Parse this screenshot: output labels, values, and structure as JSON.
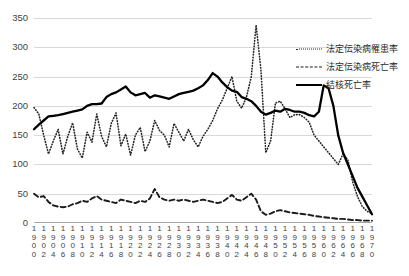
{
  "chart_data": {
    "type": "line",
    "title": "",
    "xlabel": "",
    "ylabel": "",
    "ylim": [
      0,
      350
    ],
    "ytick_step": 50,
    "yticks": [
      "0",
      "50",
      "100",
      "150",
      "200",
      "250",
      "300",
      "350"
    ],
    "grid": true,
    "legend_position": "top-right",
    "x": [
      1900,
      1901,
      1902,
      1903,
      1904,
      1905,
      1906,
      1907,
      1908,
      1909,
      1910,
      1911,
      1912,
      1913,
      1914,
      1915,
      1916,
      1917,
      1918,
      1919,
      1920,
      1921,
      1922,
      1923,
      1924,
      1925,
      1926,
      1927,
      1928,
      1929,
      1930,
      1931,
      1932,
      1933,
      1934,
      1935,
      1936,
      1937,
      1938,
      1939,
      1940,
      1941,
      1942,
      1943,
      1944,
      1945,
      1946,
      1947,
      1948,
      1949,
      1950,
      1951,
      1952,
      1953,
      1954,
      1955,
      1956,
      1957,
      1958,
      1959,
      1960,
      1961,
      1962,
      1963,
      1964,
      1965,
      1966,
      1967,
      1968,
      1969,
      1970
    ],
    "xtick_labels": [
      "1900",
      "1902",
      "1904",
      "1906",
      "1908",
      "1910",
      "1912",
      "1914",
      "1916",
      "1918",
      "1920",
      "1922",
      "1924",
      "1926",
      "1928",
      "1930",
      "1932",
      "1934",
      "1936",
      "1938",
      "1940",
      "1942",
      "1944",
      "1946",
      "1948",
      "1950",
      "1952",
      "1954",
      "1956",
      "1958",
      "1960",
      "1962",
      "1964",
      "1966",
      "1968",
      "1970"
    ],
    "series": [
      {
        "name": "法定伝染病罹患率",
        "style": "dotted",
        "color": "#262626",
        "values": [
          197,
          186,
          150,
          118,
          140,
          160,
          118,
          148,
          171,
          126,
          111,
          155,
          138,
          186,
          148,
          130,
          170,
          188,
          132,
          152,
          116,
          150,
          163,
          122,
          140,
          175,
          158,
          150,
          130,
          170,
          155,
          140,
          160,
          142,
          130,
          148,
          160,
          175,
          195,
          210,
          230,
          250,
          208,
          196,
          215,
          250,
          338,
          262,
          120,
          140,
          205,
          208,
          195,
          180,
          185,
          185,
          180,
          172,
          150,
          140,
          130,
          120,
          110,
          100,
          118,
          108,
          70,
          45,
          28,
          20,
          16
        ]
      },
      {
        "name": "法定伝染病死亡率",
        "style": "dashed",
        "color": "#1a1a1a",
        "values": [
          50,
          44,
          46,
          36,
          30,
          28,
          27,
          28,
          32,
          34,
          38,
          36,
          42,
          46,
          40,
          38,
          36,
          34,
          40,
          38,
          36,
          34,
          38,
          36,
          42,
          58,
          44,
          40,
          38,
          40,
          38,
          40,
          38,
          36,
          38,
          40,
          38,
          36,
          34,
          36,
          42,
          48,
          40,
          38,
          44,
          50,
          40,
          20,
          14,
          16,
          20,
          22,
          20,
          18,
          17,
          16,
          15,
          14,
          12,
          11,
          10,
          9,
          8,
          7,
          7,
          6,
          5,
          5,
          4,
          4,
          4
        ]
      },
      {
        "name": "結核死亡率",
        "style": "solid",
        "color": "#000000",
        "values": [
          160,
          168,
          175,
          182,
          183,
          184,
          186,
          188,
          190,
          192,
          194,
          200,
          203,
          203,
          204,
          215,
          220,
          223,
          228,
          233,
          223,
          218,
          220,
          222,
          214,
          218,
          216,
          214,
          212,
          216,
          220,
          222,
          224,
          226,
          230,
          235,
          244,
          256,
          250,
          240,
          232,
          226,
          224,
          215,
          212,
          208,
          200,
          190,
          185,
          188,
          192,
          190,
          195,
          193,
          190,
          190,
          188,
          184,
          182,
          190,
          235,
          230,
          200,
          150,
          120,
          100,
          80,
          60,
          45,
          30,
          15
        ]
      }
    ]
  },
  "legend": {
    "items": [
      {
        "label": "法定伝染病罹患率",
        "style": "dotted"
      },
      {
        "label": "法定伝染病死亡率",
        "style": "dashed"
      },
      {
        "label": "結核死亡率",
        "style": "solid"
      }
    ]
  },
  "colors": {
    "gridline": "#d9d9d9",
    "axis": "#a6a6a6",
    "text": "#3f3f3f",
    "background": "#ffffff"
  }
}
